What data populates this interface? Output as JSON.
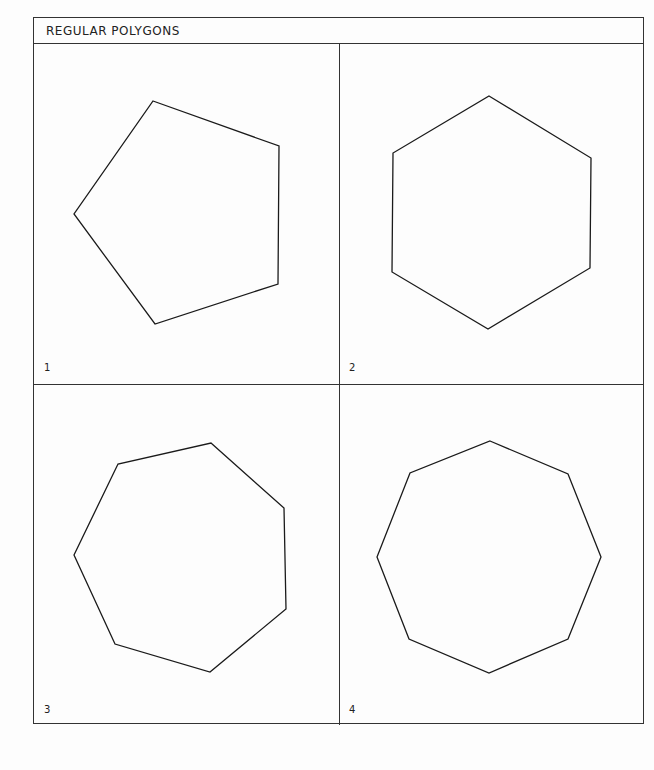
{
  "title": "REGULAR POLYGONS",
  "panels": [
    {
      "label": "1",
      "shape": "pentagon",
      "sides": 5,
      "points": "153,101 279,146 278,284 155,324 74,214"
    },
    {
      "label": "2",
      "shape": "hexagon",
      "sides": 6,
      "points": "489,96 591,158 590,268 488,329 392,272 393,153"
    },
    {
      "label": "3",
      "shape": "heptagon",
      "sides": 7,
      "points": "211,443 284,508 286,609 210,672 115,644 74,555 118,464"
    },
    {
      "label": "4",
      "shape": "octagon",
      "sides": 8,
      "points": "490,441 568,474 601,557 568,639 489,673 409,639 377,557 410,473"
    }
  ],
  "colors": {
    "stroke": "#1a1a1a",
    "background": "#fdfdfd"
  }
}
